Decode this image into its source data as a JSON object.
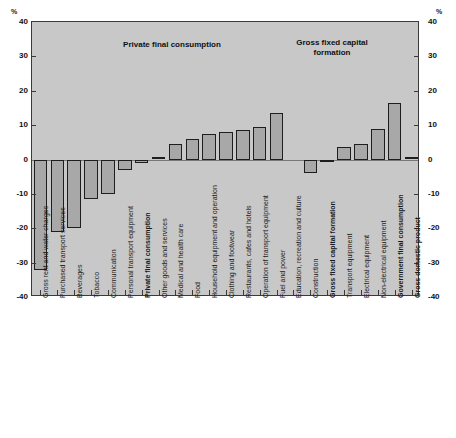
{
  "axis": {
    "unit_left": "%",
    "unit_right": "%",
    "ticks": [
      "40",
      "30",
      "20",
      "10",
      "0",
      "-10",
      "-20",
      "-30",
      "-40"
    ]
  },
  "annotations": {
    "group1": "Private final consumption",
    "group2": "Gross fixed capital\nformation"
  },
  "chart_data": {
    "type": "bar",
    "title": "",
    "xlabel": "",
    "ylabel": "%",
    "ylim": [
      -40,
      40
    ],
    "ytick_values": [
      40,
      30,
      20,
      10,
      0,
      -10,
      -20,
      -30,
      -40
    ],
    "grid": false,
    "legend": "none",
    "orientation": "vertical",
    "annotations": [
      {
        "text": "Private final consumption",
        "x_center_pct": 35.0,
        "y": 33
      },
      {
        "text": "Gross fixed capital formation",
        "x_center_pct": 78.5,
        "y": 33
      }
    ],
    "categories": [
      "Gross rent and water charges",
      "Purchased transport services",
      "Beverages",
      "Tobacco",
      "Communication",
      "Personal transport equipment",
      "Private final consumption",
      "Other goods and services",
      "Medical and health care",
      "Food",
      "Household equipment and operation",
      "Clothing and footwear",
      "Restaurants, cafes and hotels",
      "Operation of transport equipment",
      "Fuel and power",
      "Education, recreation and culture",
      "Construction",
      "Gross fixed capital formation",
      "Transport equipment",
      "Electrical equipment",
      "Non-electrical equipment",
      "Government final consumption",
      "Gross domestic product"
    ],
    "values": [
      -32.0,
      -21.0,
      -20.0,
      -11.5,
      -10.0,
      -3.0,
      -1.0,
      0.5,
      4.5,
      6.0,
      7.5,
      8.0,
      8.5,
      9.5,
      13.5,
      0,
      -4.0,
      -0.5,
      3.5,
      4.5,
      9.0,
      16.5,
      0.5
    ],
    "bold_categories": [
      "Private final consumption",
      "Gross fixed capital formation",
      "Government final consumption",
      "Gross domestic product"
    ],
    "bar_color": "#a8a8a8",
    "bar_edge_color": "#1e1e1e",
    "plot_background": "#c8c8c8"
  },
  "bars": [
    {
      "label": "Gross rent and water charges",
      "value": -32.0,
      "slot": 0,
      "bold": false
    },
    {
      "label": "Purchased transport services",
      "value": -21.0,
      "slot": 1,
      "bold": false
    },
    {
      "label": "Beverages",
      "value": -20.0,
      "slot": 2,
      "bold": false
    },
    {
      "label": "Tobacco",
      "value": -11.5,
      "slot": 3,
      "bold": false
    },
    {
      "label": "Communication",
      "value": -10.0,
      "slot": 4,
      "bold": false
    },
    {
      "label": "Personal transport equipment",
      "value": -3.0,
      "slot": 5,
      "bold": false
    },
    {
      "label": "Private final consumption",
      "value": -1.0,
      "slot": 6,
      "bold": true
    },
    {
      "label": "Other goods and services",
      "value": 0.5,
      "slot": 7,
      "bold": false
    },
    {
      "label": "Medical and health care",
      "value": 4.5,
      "slot": 8,
      "bold": false
    },
    {
      "label": "Food",
      "value": 6.0,
      "slot": 9,
      "bold": false
    },
    {
      "label": "Household equipment and operation",
      "value": 7.5,
      "slot": 10,
      "bold": false
    },
    {
      "label": "Clothing and footwear",
      "value": 8.0,
      "slot": 11,
      "bold": false
    },
    {
      "label": "Restaurants, cafes and hotels",
      "value": 8.5,
      "slot": 12,
      "bold": false
    },
    {
      "label": "Operation of transport equipment",
      "value": 9.5,
      "slot": 13,
      "bold": false
    },
    {
      "label": "Fuel and power",
      "value": 13.5,
      "slot": 14,
      "bold": false
    },
    {
      "label": "Education, recreation and culture",
      "value": 0,
      "slot": 15,
      "bold": false,
      "hidden": true
    },
    {
      "label": "Construction",
      "value": -4.0,
      "slot": 16,
      "bold": false
    },
    {
      "label": "Gross fixed capital formation",
      "value": -0.5,
      "slot": 17,
      "bold": true
    },
    {
      "label": "Transport equipment",
      "value": 3.5,
      "slot": 18,
      "bold": false
    },
    {
      "label": "Electrical equipment",
      "value": 4.5,
      "slot": 19,
      "bold": false
    },
    {
      "label": "Non-electrical equipment",
      "value": 9.0,
      "slot": 20,
      "bold": false
    },
    {
      "label": "Government final consumption",
      "value": 16.5,
      "slot": 21,
      "bold": true
    },
    {
      "label": "Gross domestic product",
      "value": 0.5,
      "slot": 22,
      "bold": true
    }
  ]
}
